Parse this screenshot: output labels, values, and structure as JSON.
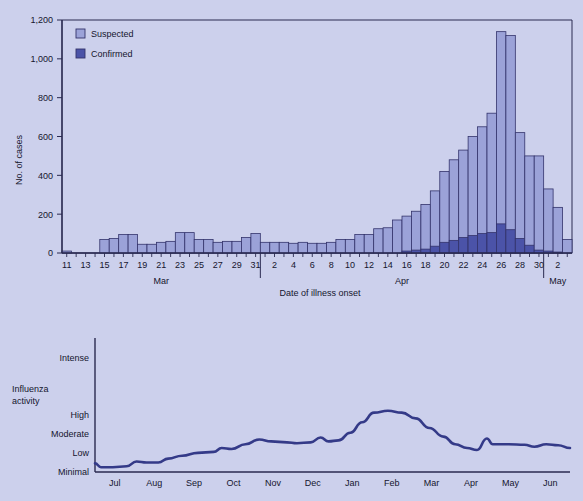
{
  "background_color": "#ccd0ec",
  "colors": {
    "suspected_fill": "#9ba2d8",
    "confirmed_fill": "#4b53a8",
    "bar_stroke": "#33336b",
    "axis": "#2a2a50",
    "line": "#343a88",
    "text": "#15152e"
  },
  "top_chart": {
    "ylabel": "No. of cases",
    "xlabel": "Date of illness onset",
    "ylim": [
      0,
      1200
    ],
    "yticks": [
      "0",
      "200",
      "400",
      "600",
      "800",
      "1,000",
      "1,200"
    ],
    "ytick_values": [
      0,
      200,
      400,
      600,
      800,
      1000,
      1200
    ],
    "legend": [
      {
        "label": "Suspected",
        "color": "#9ba2d8"
      },
      {
        "label": "Confirmed",
        "color": "#4b53a8"
      }
    ],
    "month_labels": [
      "Mar",
      "Apr",
      "May"
    ],
    "xtick_labels": [
      "11",
      "13",
      "15",
      "17",
      "19",
      "21",
      "23",
      "25",
      "27",
      "29",
      "31",
      "2",
      "4",
      "6",
      "8",
      "10",
      "12",
      "14",
      "16",
      "18",
      "20",
      "22",
      "24",
      "26",
      "28",
      "30",
      "2"
    ]
  },
  "bottom_chart": {
    "ylabel_line1": "Influenza",
    "ylabel_line2": "activity",
    "yticks": [
      "Intense",
      "High",
      "Moderate",
      "Low",
      "Minimal"
    ],
    "xtick_labels": [
      "Jul",
      "Aug",
      "Sep",
      "Oct",
      "Nov",
      "Dec",
      "Jan",
      "Feb",
      "Mar",
      "Apr",
      "May",
      "Jun"
    ]
  },
  "chart_data": [
    {
      "type": "bar",
      "title": "",
      "xlabel": "Date of illness onset",
      "ylabel": "No. of cases",
      "ylim": [
        0,
        1200
      ],
      "grid": false,
      "legend_position": "top-left",
      "stacked": true,
      "categories": [
        "Mar 11",
        "Mar 12",
        "Mar 13",
        "Mar 14",
        "Mar 15",
        "Mar 16",
        "Mar 17",
        "Mar 18",
        "Mar 19",
        "Mar 20",
        "Mar 21",
        "Mar 22",
        "Mar 23",
        "Mar 24",
        "Mar 25",
        "Mar 26",
        "Mar 27",
        "Mar 28",
        "Mar 29",
        "Mar 30",
        "Mar 31",
        "Apr 1",
        "Apr 2",
        "Apr 3",
        "Apr 4",
        "Apr 5",
        "Apr 6",
        "Apr 7",
        "Apr 8",
        "Apr 9",
        "Apr 10",
        "Apr 11",
        "Apr 12",
        "Apr 13",
        "Apr 14",
        "Apr 15",
        "Apr 16",
        "Apr 17",
        "Apr 18",
        "Apr 19",
        "Apr 20",
        "Apr 21",
        "Apr 22",
        "Apr 23",
        "Apr 24",
        "Apr 25",
        "Apr 26",
        "Apr 27",
        "Apr 28",
        "Apr 29",
        "Apr 30",
        "May 1",
        "May 2",
        "May 3"
      ],
      "series": [
        {
          "name": "Suspected",
          "color": "#9ba2d8",
          "values": [
            10,
            0,
            0,
            0,
            70,
            75,
            95,
            95,
            45,
            45,
            55,
            60,
            105,
            105,
            70,
            70,
            55,
            60,
            60,
            80,
            100,
            55,
            55,
            55,
            50,
            55,
            50,
            50,
            55,
            70,
            70,
            95,
            95,
            125,
            130,
            170,
            190,
            215,
            250,
            320,
            420,
            480,
            530,
            600,
            650,
            720,
            1140,
            1120,
            620,
            500,
            500,
            330,
            235,
            70
          ]
        },
        {
          "name": "Confirmed",
          "color": "#4b53a8",
          "values": [
            0,
            0,
            0,
            0,
            0,
            0,
            0,
            0,
            0,
            0,
            0,
            0,
            0,
            0,
            0,
            0,
            0,
            0,
            0,
            0,
            0,
            0,
            0,
            0,
            0,
            0,
            0,
            0,
            0,
            0,
            0,
            0,
            0,
            0,
            0,
            0,
            10,
            15,
            20,
            35,
            55,
            65,
            80,
            90,
            100,
            105,
            150,
            120,
            75,
            40,
            15,
            10,
            5,
            0
          ]
        }
      ]
    },
    {
      "type": "line",
      "title": "",
      "xlabel": "",
      "ylabel": "Influenza activity",
      "ytick_labels": [
        "Minimal",
        "Low",
        "Moderate",
        "High",
        "Intense"
      ],
      "ytick_values": [
        0,
        1,
        2,
        3,
        6
      ],
      "ylim": [
        0,
        7
      ],
      "grid": false,
      "legend_position": "none",
      "x": [
        "Jul",
        "Aug",
        "Sep",
        "Oct",
        "Nov",
        "Dec",
        "Jan",
        "Feb",
        "Mar",
        "Apr",
        "May",
        "Jun"
      ],
      "series": [
        {
          "name": "Influenza activity",
          "color": "#343a88",
          "values_detailed": [
            {
              "x": 0.0,
              "y": 0.45
            },
            {
              "x": 0.15,
              "y": 0.25
            },
            {
              "x": 0.45,
              "y": 0.25
            },
            {
              "x": 0.8,
              "y": 0.3
            },
            {
              "x": 1.05,
              "y": 0.55
            },
            {
              "x": 1.3,
              "y": 0.5
            },
            {
              "x": 1.6,
              "y": 0.5
            },
            {
              "x": 1.85,
              "y": 0.7
            },
            {
              "x": 2.2,
              "y": 0.85
            },
            {
              "x": 2.6,
              "y": 1.0
            },
            {
              "x": 3.0,
              "y": 1.05
            },
            {
              "x": 3.2,
              "y": 1.25
            },
            {
              "x": 3.45,
              "y": 1.2
            },
            {
              "x": 3.8,
              "y": 1.45
            },
            {
              "x": 4.15,
              "y": 1.7
            },
            {
              "x": 4.45,
              "y": 1.6
            },
            {
              "x": 4.85,
              "y": 1.55
            },
            {
              "x": 5.1,
              "y": 1.5
            },
            {
              "x": 5.45,
              "y": 1.55
            },
            {
              "x": 5.7,
              "y": 1.8
            },
            {
              "x": 5.9,
              "y": 1.6
            },
            {
              "x": 6.15,
              "y": 1.65
            },
            {
              "x": 6.45,
              "y": 2.05
            },
            {
              "x": 6.75,
              "y": 2.6
            },
            {
              "x": 7.05,
              "y": 3.1
            },
            {
              "x": 7.4,
              "y": 3.2
            },
            {
              "x": 7.75,
              "y": 3.1
            },
            {
              "x": 8.1,
              "y": 2.8
            },
            {
              "x": 8.45,
              "y": 2.3
            },
            {
              "x": 8.8,
              "y": 1.85
            },
            {
              "x": 9.1,
              "y": 1.45
            },
            {
              "x": 9.4,
              "y": 1.25
            },
            {
              "x": 9.65,
              "y": 1.15
            },
            {
              "x": 9.9,
              "y": 1.75
            },
            {
              "x": 10.05,
              "y": 1.45
            },
            {
              "x": 10.45,
              "y": 1.45
            },
            {
              "x": 10.85,
              "y": 1.42
            },
            {
              "x": 11.1,
              "y": 1.32
            },
            {
              "x": 11.4,
              "y": 1.45
            },
            {
              "x": 11.7,
              "y": 1.4
            },
            {
              "x": 12.0,
              "y": 1.25
            }
          ]
        }
      ]
    }
  ]
}
